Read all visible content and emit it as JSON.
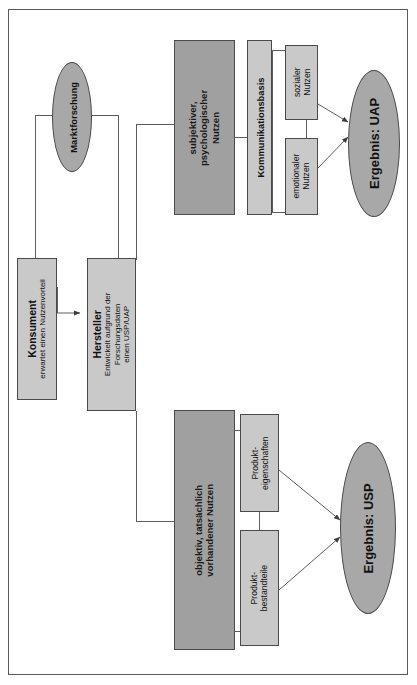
{
  "diagram": {
    "language": "de",
    "orientation": "rotated-90-ccw",
    "colors": {
      "light_box": "#c9c9c9",
      "dark_box": "#a0a0a0",
      "ellipse": "#a8a8a8",
      "line": "#5c5c5c",
      "border": "#4a4a4a",
      "page": "#ffffff"
    },
    "nodes": {
      "marktforschung": {
        "label": "Marktforschung",
        "shape": "ellipse"
      },
      "konsument": {
        "title": "Konsument",
        "subtitle": "erwartet einen Nutzenvorteil",
        "shape": "rect"
      },
      "hersteller": {
        "title": "Hersteller",
        "subtitle_line1": "Entwickelt aufgrund der",
        "subtitle_line2": "Forschungsdaten",
        "subtitle_line3": "einen USP/UAP",
        "shape": "rect"
      },
      "subjektiver_nutzen": {
        "line1": "subjektiver,",
        "line2": "psychologischer",
        "line3": "Nutzen",
        "shape": "rect-dark"
      },
      "objektiver_nutzen": {
        "line1": "objektiv, tatsächlich",
        "line2": "vorhandener Nutzen",
        "shape": "rect-dark"
      },
      "kommunikationsbasis": {
        "label": "Kommunikationsbasis",
        "shape": "rect"
      },
      "sozialer_nutzen": {
        "line1": "sozialer",
        "line2": "Nutzen",
        "shape": "rect"
      },
      "emotionaler_nutzen": {
        "line1": "emotionaler",
        "line2": "Nutzen",
        "shape": "rect"
      },
      "produkteigenschaften": {
        "line1": "Produkt-",
        "line2": "eigenschaften",
        "shape": "rect"
      },
      "produktbestandteile": {
        "line1": "Produkt-",
        "line2": "bestandteile",
        "shape": "rect"
      },
      "ergebnis_uap": {
        "label": "Ergebnis: UAP",
        "shape": "ellipse"
      },
      "ergebnis_usp": {
        "label": "Ergebnis: USP",
        "shape": "ellipse"
      }
    },
    "edges": [
      {
        "from": "konsument",
        "to": "hersteller",
        "arrow": true
      },
      {
        "from": "konsument",
        "to": "marktforschung",
        "arrow": false
      },
      {
        "from": "marktforschung",
        "to": "hersteller",
        "arrow": false
      },
      {
        "from": "hersteller",
        "to": "subjektiver_nutzen",
        "arrow": false
      },
      {
        "from": "hersteller",
        "to": "objektiver_nutzen",
        "arrow": false
      },
      {
        "from": "subjektiver_nutzen",
        "to": "kommunikationsbasis",
        "arrow": false
      },
      {
        "from": "kommunikationsbasis",
        "to": "sozialer_nutzen",
        "arrow": false
      },
      {
        "from": "kommunikationsbasis",
        "to": "emotionaler_nutzen",
        "arrow": false
      },
      {
        "from": "sozialer_nutzen",
        "to": "ergebnis_uap",
        "arrow": true
      },
      {
        "from": "emotionaler_nutzen",
        "to": "ergebnis_uap",
        "arrow": true
      },
      {
        "from": "objektiver_nutzen",
        "to": "produkteigenschaften",
        "arrow": false
      },
      {
        "from": "objektiver_nutzen",
        "to": "produktbestandteile",
        "arrow": false
      },
      {
        "from": "produkteigenschaften",
        "to": "ergebnis_usp",
        "arrow": true
      },
      {
        "from": "produktbestandteile",
        "to": "ergebnis_usp",
        "arrow": true
      }
    ]
  }
}
